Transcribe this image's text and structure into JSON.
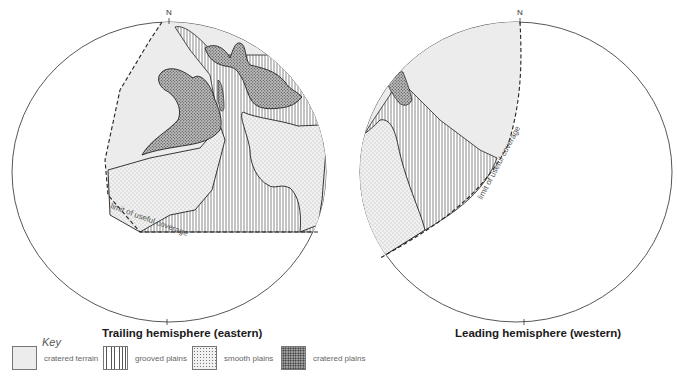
{
  "figure": {
    "hemispheres": [
      {
        "id": "trailing",
        "title": "Trailing hemisphere (eastern)",
        "north_label": "N",
        "annotation": "limit of useful coverage"
      },
      {
        "id": "leading",
        "title": "Leading hemisphere (western)",
        "north_label": "N",
        "annotation": "limit of useful coverage"
      }
    ],
    "key": {
      "title": "Key",
      "items": [
        {
          "label": "cratered terrain",
          "pattern": "light-gray-fill"
        },
        {
          "label": "grooved plains",
          "pattern": "vertical-lines"
        },
        {
          "label": "smooth plains",
          "pattern": "fine-stipple"
        },
        {
          "label": "cratered plains",
          "pattern": "dense-stipple"
        }
      ]
    },
    "colors": {
      "outline": "#333333",
      "cratered_terrain": "#ececec",
      "background": "#ffffff"
    }
  }
}
